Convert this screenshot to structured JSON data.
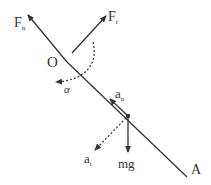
{
  "diagram": {
    "title": "",
    "labels": {
      "Fn_main": "F",
      "Fn_sub": "n",
      "Ft_main": "F",
      "Ft_sub": "t",
      "O": "O",
      "alpha": "α",
      "an_main": "a",
      "an_sub": "n",
      "at_main": "a",
      "at_sub": "t",
      "mg": "mg",
      "A": "A"
    },
    "colors": {
      "line": "#333333",
      "text": "#333333"
    }
  }
}
